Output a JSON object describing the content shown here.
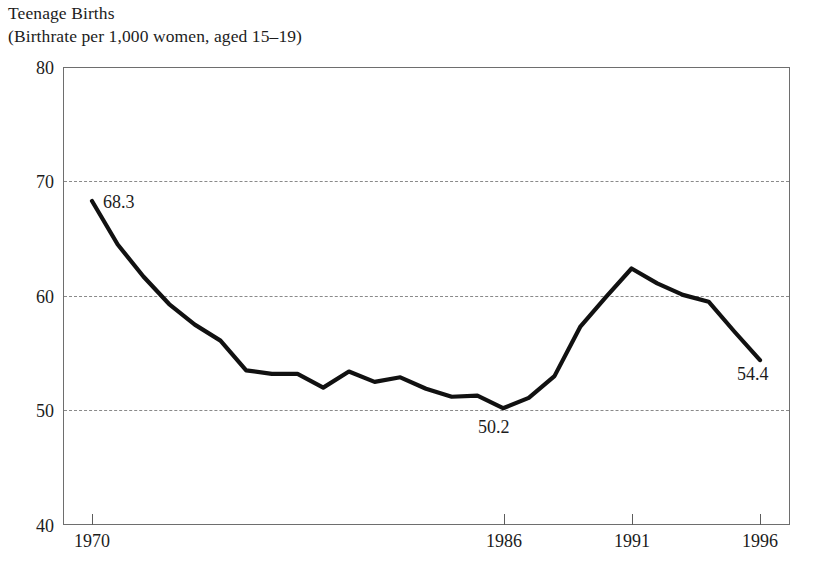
{
  "title": {
    "line1": "Teenage Births",
    "line2": "(Birthrate per 1,000 women, aged 15–19)"
  },
  "axis": {
    "y_ticks_major": [
      "40",
      "50",
      "60",
      "70",
      "80"
    ],
    "y_ticks_minor": [
      "45",
      "55",
      "65",
      "75"
    ],
    "x_ticks": [
      "1970",
      "1986",
      "1991",
      "1996"
    ]
  },
  "annotations": {
    "start": "68.3",
    "minimum": "50.2",
    "end": "54.4"
  },
  "colors": {
    "line": "#111111",
    "frame": "#6e6e6e",
    "grid": "#8a8a8a",
    "text": "#1c1c1c",
    "background": "#ffffff"
  },
  "chart_data": {
    "type": "line",
    "title": "Teenage Births",
    "subtitle": "(Birthrate per 1,000 women, aged 15–19)",
    "xlabel": "",
    "ylabel": "Birthrate per 1,000 women, aged 15-19",
    "xlim": [
      1970,
      1996
    ],
    "ylim": [
      40,
      80
    ],
    "ytick_values": [
      40,
      50,
      60,
      70,
      80
    ],
    "yminor_tick_values": [
      45,
      55,
      65,
      75
    ],
    "xtick_values": [
      1970,
      1986,
      1991,
      1996
    ],
    "gridlines_y": [
      50,
      60,
      70
    ],
    "grid": "dashed horizontal at 50, 60, 70",
    "legend": "none",
    "x": [
      1970,
      1971,
      1972,
      1973,
      1974,
      1975,
      1976,
      1977,
      1978,
      1979,
      1980,
      1981,
      1982,
      1983,
      1984,
      1985,
      1986,
      1987,
      1988,
      1989,
      1990,
      1991,
      1992,
      1993,
      1994,
      1995,
      1996
    ],
    "values": [
      68.3,
      64.5,
      61.7,
      59.3,
      57.5,
      56.1,
      53.5,
      53.2,
      53.2,
      52.0,
      53.4,
      52.5,
      52.9,
      51.9,
      51.2,
      51.3,
      50.2,
      51.1,
      53.0,
      57.3,
      59.9,
      62.4,
      61.1,
      60.1,
      59.5,
      56.9,
      54.4
    ],
    "annotated_points": [
      {
        "x": 1970,
        "y": 68.3,
        "label": "68.3"
      },
      {
        "x": 1986,
        "y": 50.2,
        "label": "50.2"
      },
      {
        "x": 1996,
        "y": 54.4,
        "label": "54.4"
      }
    ]
  }
}
